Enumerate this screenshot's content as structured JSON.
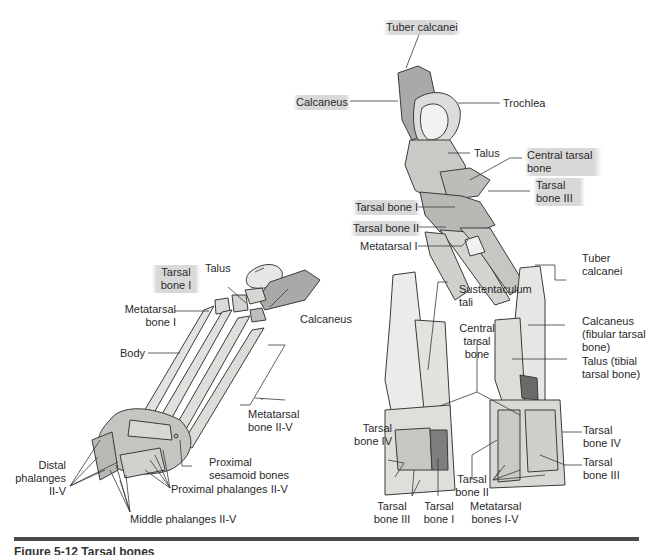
{
  "figure": {
    "caption": "Figure 5-12  Tarsal bones",
    "panels": {
      "top_lateral_view": {
        "labels": {
          "tuber_calcanei": "Tuber calcanei",
          "calcaneus": "Calcaneus",
          "trochlea": "Trochlea",
          "talus": "Talus",
          "central_tarsal_bone": "Central tarsal bone",
          "tarsal_bone_iii": "Tarsal bone III",
          "tarsal_bone_i": "Tarsal bone I",
          "tarsal_bone_ii": "Tarsal bone II",
          "metatarsal_i": "Metatarsal I"
        }
      },
      "left_foot_view": {
        "labels": {
          "talus": "Talus",
          "tarsal_bone_i": "Tarsal bone I",
          "metatarsal_bone_i": "Metatarsal bone I",
          "calcaneus": "Calcaneus",
          "body": "Body",
          "metatarsal_bone_ii_v": "Metatarsal bone II-V",
          "proximal_sesamoid_bones": "Proximal sesamoid bones",
          "distal_phalanges": "Distal phalanges II-V",
          "proximal_phalanges": "Proximal phalanges II-V",
          "middle_phalanges": "Middle phalanges II-V"
        }
      },
      "bottom_right_views": {
        "labels": {
          "sustentaculum_tali": "Sustentaculum tali",
          "central_tarsal_bone": "Central tarsal bone",
          "tuber_calcanei": "Tuber calcanei",
          "calcaneus": "Calcaneus (fibular tarsal bone)",
          "talus": "Talus (tibial tarsal bone)",
          "tarsal_bone_iv_left": "Tarsal bone IV",
          "tarsal_bone_iii_left": "Tarsal bone III",
          "tarsal_bone_i": "Tarsal bone I",
          "tarsal_bone_ii": "Tarsal bone II",
          "metatarsal_bones": "Metatarsal bones I-V",
          "tarsal_bone_iv_right": "Tarsal bone IV",
          "tarsal_bone_iii_right": "Tarsal bone III"
        }
      }
    },
    "colors": {
      "bone_fill": "#e8e8e6",
      "bone_shade": "#b9b9b6",
      "bone_dark": "#8c8c8a",
      "outline": "#3a3a3a",
      "highlight": "#d2d2d2",
      "rule": "#4a4a4a"
    }
  }
}
